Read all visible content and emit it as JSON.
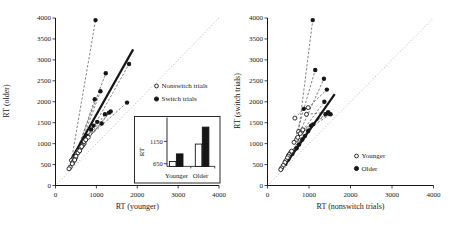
{
  "style": {
    "ink": "#161616",
    "open_fill": "#ffffff",
    "identity_color": "#b9b9b9",
    "pair_line_color": "#4d4d4d",
    "background": "#ffffff"
  },
  "chart_data": [
    {
      "type": "scatter",
      "panel": "left",
      "xlabel": "RT (younger)",
      "ylabel": "RT (older)",
      "xlim": [
        0,
        4000
      ],
      "ylim": [
        0,
        4000
      ],
      "xticks": [
        0,
        1000,
        2000,
        3000,
        4000
      ],
      "yticks": [
        0,
        500,
        1000,
        1500,
        2000,
        2500,
        3000,
        3500,
        4000
      ],
      "grid": false,
      "identity_line": true,
      "legend": [
        {
          "label": "Nonswitch trials",
          "marker": "open"
        },
        {
          "label": "Switch trials",
          "marker": "filled"
        }
      ],
      "legend_position": "middle-right",
      "fit_line": {
        "from": [
          400,
          650
        ],
        "to": [
          1900,
          3250
        ]
      },
      "pairs": [
        {
          "open": [
            390,
            600
          ],
          "filled": [
            980,
            3950
          ]
        },
        {
          "open": [
            450,
            650
          ],
          "filled": [
            1230,
            2680
          ]
        },
        {
          "open": [
            700,
            1000
          ],
          "filled": [
            1800,
            2900
          ]
        },
        {
          "open": [
            560,
            830
          ],
          "filled": [
            1100,
            2250
          ]
        },
        {
          "open": [
            520,
            760
          ],
          "filled": [
            960,
            2060
          ]
        },
        {
          "open": [
            800,
            1150
          ],
          "filled": [
            1750,
            1980
          ]
        },
        {
          "open": [
            660,
            950
          ],
          "filled": [
            1350,
            1770
          ]
        },
        {
          "open": [
            620,
            900
          ],
          "filled": [
            1310,
            1740
          ]
        },
        {
          "open": [
            640,
            930
          ],
          "filled": [
            1210,
            1700
          ]
        },
        {
          "open": [
            480,
            650
          ],
          "filled": [
            760,
            1190
          ]
        },
        {
          "open": [
            430,
            560
          ],
          "filled": [
            640,
            930
          ]
        },
        {
          "open": [
            550,
            780
          ],
          "filled": [
            870,
            1340
          ]
        },
        {
          "open": [
            590,
            830
          ],
          "filled": [
            930,
            1430
          ]
        },
        {
          "open": [
            360,
            440
          ],
          "filled": [
            500,
            680
          ]
        },
        {
          "open": [
            410,
            520
          ],
          "filled": [
            580,
            820
          ]
        },
        {
          "open": [
            700,
            1050
          ],
          "filled": [
            1020,
            1520
          ]
        },
        {
          "open": [
            740,
            1090
          ],
          "filled": [
            1130,
            1480
          ]
        },
        {
          "open": [
            330,
            400
          ],
          "filled": [
            420,
            540
          ]
        },
        {
          "open": [
            500,
            700
          ],
          "filled": [
            690,
            1060
          ]
        },
        {
          "open": [
            470,
            610
          ],
          "filled": [
            730,
            1130
          ]
        }
      ]
    },
    {
      "type": "scatter",
      "panel": "right",
      "xlabel": "RT (nonswitch trials)",
      "ylabel": "RT (switch trials)",
      "xlim": [
        0,
        4000
      ],
      "ylim": [
        0,
        4000
      ],
      "xticks": [
        0,
        1000,
        2000,
        3000,
        4000
      ],
      "yticks": [
        0,
        500,
        1000,
        1500,
        2000,
        2500,
        3000,
        3500,
        4000
      ],
      "grid": false,
      "identity_line": true,
      "legend": [
        {
          "label": "Younger",
          "marker": "open"
        },
        {
          "label": "Older",
          "marker": "filled"
        }
      ],
      "legend_position": "lower-right",
      "fit_line": {
        "from": [
          420,
          480
        ],
        "to": [
          1620,
          2180
        ]
      },
      "pairs": [
        {
          "open": [
            750,
            1290
          ],
          "filled": [
            1090,
            3950
          ]
        },
        {
          "open": [
            640,
            1030
          ],
          "filled": [
            1150,
            2760
          ]
        },
        {
          "open": [
            700,
            1100
          ],
          "filled": [
            1360,
            2550
          ]
        },
        {
          "open": [
            730,
            1150
          ],
          "filled": [
            1370,
            2000
          ]
        },
        {
          "open": [
            980,
            1860
          ],
          "filled": [
            1430,
            2290
          ]
        },
        {
          "open": [
            940,
            1700
          ],
          "filled": [
            1460,
            1750
          ]
        },
        {
          "open": [
            820,
            1280
          ],
          "filled": [
            1400,
            1700
          ]
        },
        {
          "open": [
            850,
            1330
          ],
          "filled": [
            1480,
            1720
          ]
        },
        {
          "open": [
            790,
            1240
          ],
          "filled": [
            1520,
            1700
          ]
        },
        {
          "open": [
            660,
            1610
          ],
          "filled": [
            875,
            1830
          ]
        },
        {
          "open": [
            560,
            790
          ],
          "filled": [
            1050,
            1430
          ]
        },
        {
          "open": [
            580,
            820
          ],
          "filled": [
            1100,
            1460
          ]
        },
        {
          "open": [
            520,
            740
          ],
          "filled": [
            980,
            1300
          ]
        },
        {
          "open": [
            500,
            700
          ],
          "filled": [
            900,
            1180
          ]
        },
        {
          "open": [
            480,
            660
          ],
          "filled": [
            840,
            1100
          ]
        },
        {
          "open": [
            440,
            590
          ],
          "filled": [
            760,
            980
          ]
        },
        {
          "open": [
            420,
            550
          ],
          "filled": [
            700,
            890
          ]
        },
        {
          "open": [
            380,
            480
          ],
          "filled": [
            600,
            760
          ]
        },
        {
          "open": [
            340,
            420
          ],
          "filled": [
            500,
            620
          ]
        },
        {
          "open": [
            320,
            380
          ],
          "filled": [
            430,
            520
          ]
        }
      ]
    },
    {
      "type": "bar",
      "panel": "left-inset",
      "ylabel": "RT",
      "yticks": [
        650,
        1150
      ],
      "ylim": [
        590,
        1600
      ],
      "categories": [
        "Younger",
        "Older"
      ],
      "series": [
        {
          "name": "Nonswitch trials",
          "fill": "open",
          "values": [
            700,
            1090
          ]
        },
        {
          "name": "Switch trials",
          "fill": "filled",
          "values": [
            870,
            1470
          ]
        }
      ]
    }
  ]
}
